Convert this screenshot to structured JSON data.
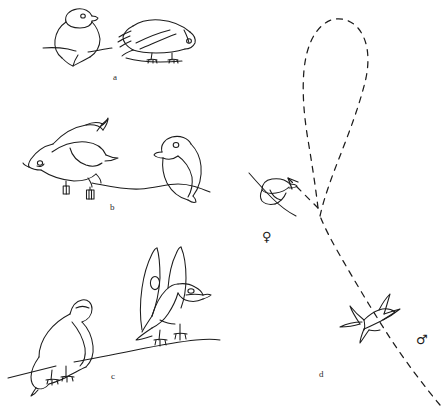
{
  "figure": {
    "title": "",
    "background_color": "#ffffff",
    "ink_color": "#1c1c1c",
    "width": 448,
    "height": 409,
    "style": "hand-drawn line art, pen and ink, no shading"
  },
  "panels": [
    {
      "id": "a",
      "label": "a",
      "label_position": {
        "x": 113,
        "y": 72
      },
      "subjects": [
        {
          "name": "fluffed-perched-bird",
          "posture": "upright, feathers fluffed, rounded body, head tucked, perched on branch",
          "facing": "right",
          "position": {
            "x": 48,
            "y": 8
          }
        },
        {
          "name": "crouched-horizontal-bird",
          "posture": "body horizontal and flattened, head low, wings folded, standing on branch",
          "facing": "right",
          "position": {
            "x": 120,
            "y": 18
          }
        }
      ],
      "perch": "horizontal branch line beneath both birds"
    },
    {
      "id": "b",
      "label": "b",
      "label_position": {
        "x": 110,
        "y": 202
      },
      "subjects": [
        {
          "name": "bowing-bird",
          "posture": "head and bill lowered toward perch, tail raised, wings slightly lifted",
          "facing": "left",
          "position": {
            "x": 30,
            "y": 112
          }
        },
        {
          "name": "upright-watching-bird",
          "posture": "upright, rounded body, head up and alert, perched",
          "facing": "left",
          "position": {
            "x": 150,
            "y": 132
          }
        }
      ],
      "perch": "wavy branch line beneath both birds"
    },
    {
      "id": "c",
      "label": "c",
      "label_position": {
        "x": 111,
        "y": 371
      },
      "subjects": [
        {
          "name": "head-down-bird",
          "posture": "deep bow, head hanging below perch level, body hunched",
          "facing": "left",
          "position": {
            "x": 26,
            "y": 292
          }
        },
        {
          "name": "wings-raised-bird",
          "posture": "both wings lifted high above back in V shape, bill open, head forward",
          "facing": "right",
          "position": {
            "x": 128,
            "y": 244
          }
        }
      ],
      "perch": "branch line rising from lower-left to right"
    },
    {
      "id": "d",
      "label": "d",
      "label_position": {
        "x": 319,
        "y": 369
      },
      "subjects": [
        {
          "name": "perched-female-bird",
          "posture": "small bird on thin perch, wings folded",
          "facing": "right",
          "position": {
            "x": 260,
            "y": 178
          },
          "sex_symbol": "♀"
        },
        {
          "name": "flying-male-bird",
          "posture": "in flight, wings spread, seen from below",
          "facing": "upper-right",
          "position": {
            "x": 362,
            "y": 320
          },
          "sex_symbol": "♂"
        }
      ],
      "flight_path": {
        "name": "dashed-loop-trajectory",
        "description": "long dashed line rising from lower right, forming a tall narrow loop at the top, crossing itself and descending with an arrowhead pointing down-left toward the perched bird",
        "arrowhead": "down-left, near the perched female bird",
        "line_style": "dashed"
      }
    }
  ],
  "symbols": {
    "female": "♀",
    "female_label": "female-symbol",
    "male": "♂",
    "male_label": "male-symbol"
  }
}
